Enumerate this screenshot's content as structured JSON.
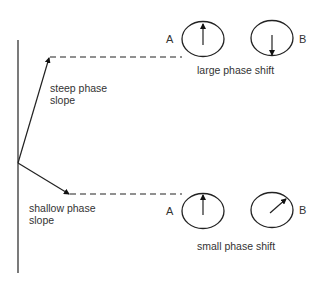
{
  "diagram": {
    "top": {
      "slope_label_line1": "steep phase",
      "slope_label_line2": "slope",
      "caption": "large phase shift",
      "dial_a_label": "A",
      "dial_b_label": "B",
      "dial_a_direction": "up",
      "dial_b_direction": "down"
    },
    "bottom": {
      "slope_label_line1": "shallow phase",
      "slope_label_line2": "slope",
      "caption": "small phase shift",
      "dial_a_label": "A",
      "dial_b_label": "B",
      "dial_a_direction": "up",
      "dial_b_direction": "up-right"
    }
  }
}
